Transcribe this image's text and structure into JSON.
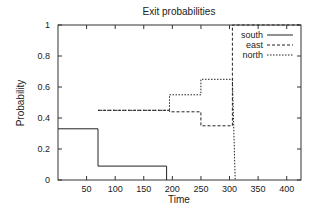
{
  "chart_data": {
    "type": "line",
    "title": "Exit probabilities",
    "xlabel": "Time",
    "ylabel": "Probability",
    "xlim": [
      0,
      425
    ],
    "ylim": [
      0,
      1
    ],
    "xticks": [
      50,
      100,
      150,
      200,
      250,
      300,
      350,
      400
    ],
    "yticks": [
      0,
      0.2,
      0.4,
      0.6,
      0.8,
      1
    ],
    "ytick_labels": [
      "0",
      "0.2",
      "0.4",
      "0.6",
      "0.8",
      "1"
    ],
    "grid": false,
    "legend_position": "top-right",
    "step": true,
    "series": [
      {
        "name": "south",
        "style": "solid",
        "x": [
          0,
          70,
          70,
          190,
          190
        ],
        "y": [
          0.33,
          0.33,
          0.09,
          0.09,
          0.0
        ]
      },
      {
        "name": "east",
        "style": "dashed",
        "x": [
          70,
          195,
          195,
          250,
          250,
          305,
          305,
          425
        ],
        "y": [
          0.45,
          0.45,
          0.44,
          0.44,
          0.35,
          0.35,
          1.0,
          1.0
        ]
      },
      {
        "name": "north",
        "style": "dotted",
        "x": [
          70,
          195,
          195,
          250,
          250,
          305,
          310
        ],
        "y": [
          0.45,
          0.45,
          0.55,
          0.55,
          0.65,
          0.65,
          0.0
        ]
      }
    ]
  }
}
